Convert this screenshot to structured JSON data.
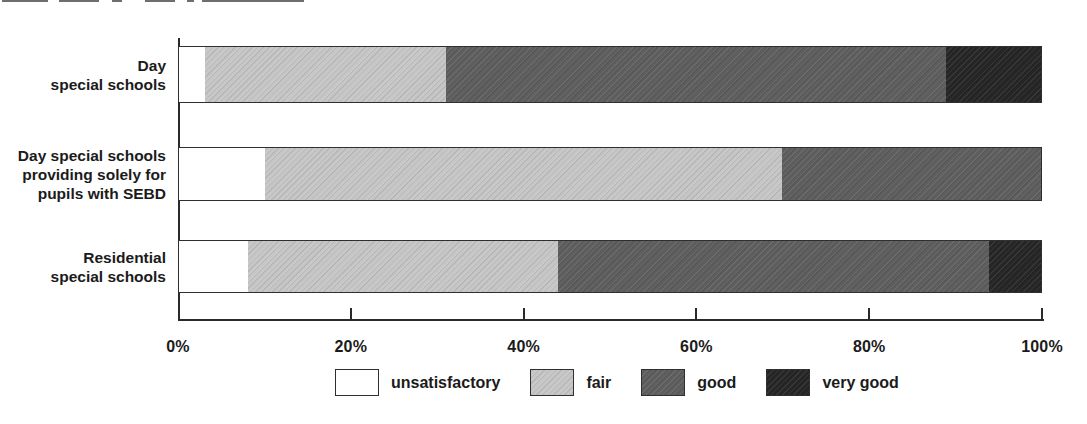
{
  "chart_data": {
    "type": "bar",
    "orientation": "horizontal",
    "stacked": true,
    "title": "",
    "xlabel": "",
    "ylabel": "",
    "xlim": [
      0,
      100
    ],
    "grid": false,
    "legend_position": "bottom",
    "categories": [
      "Day\nspecial schools",
      "Day special schools\nproviding solely for\npupils with SEBD",
      "Residential\nspecial schools"
    ],
    "series": [
      {
        "name": "unsatisfactory",
        "color": "#ffffff",
        "values": [
          3,
          10,
          8
        ]
      },
      {
        "name": "fair",
        "color": "#c6c6c6",
        "values": [
          28,
          60,
          36
        ]
      },
      {
        "name": "good",
        "color": "#5e5e5e",
        "values": [
          58,
          30,
          50
        ]
      },
      {
        "name": "very good",
        "color": "#262626",
        "values": [
          11,
          0,
          6
        ]
      }
    ],
    "x_ticks": [
      {
        "value": 0,
        "label": "0%"
      },
      {
        "value": 20,
        "label": "20%"
      },
      {
        "value": 40,
        "label": "40%"
      },
      {
        "value": 60,
        "label": "60%"
      },
      {
        "value": 80,
        "label": "80%"
      },
      {
        "value": 100,
        "label": "100%"
      }
    ],
    "colors": {
      "axis": "#2a2a2a",
      "bar_border": "#2f2f2f",
      "text": "#1b1b1b",
      "background": "#ffffff"
    }
  }
}
